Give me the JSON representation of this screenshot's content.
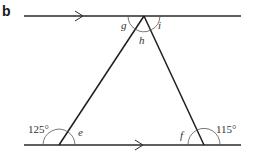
{
  "figure": {
    "part_label": "b",
    "colors": {
      "line": "#2a2a2a",
      "arc": "#555555",
      "text": "#333333"
    },
    "parallel_lines": [
      {
        "name": "top-line",
        "arrow": "single"
      },
      {
        "name": "bottom-line",
        "arrow": "single"
      }
    ],
    "angles": {
      "g": {
        "label": "g",
        "unknown": true
      },
      "h": {
        "label": "h",
        "unknown": true
      },
      "i": {
        "label": "i",
        "unknown": true
      },
      "e": {
        "label": "e",
        "unknown": true
      },
      "f": {
        "label": "f",
        "unknown": true
      },
      "left_exterior": {
        "label": "125°",
        "value": 125
      },
      "right_exterior": {
        "label": "115°",
        "value": 115
      }
    }
  }
}
